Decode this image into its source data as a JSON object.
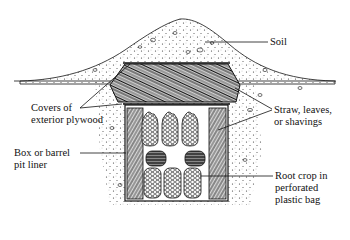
{
  "diagram": {
    "type": "cross-section illustration",
    "labels": {
      "soil": "Soil",
      "covers": "Covers of\nexterior plywood",
      "straw": "Straw, leaves,\nor shavings",
      "liner": "Box or barrel\npit liner",
      "root_crop": "Root crop in\nperforated\nplastic bag"
    },
    "colors": {
      "ink": "#111111",
      "background": "#ffffff"
    }
  }
}
